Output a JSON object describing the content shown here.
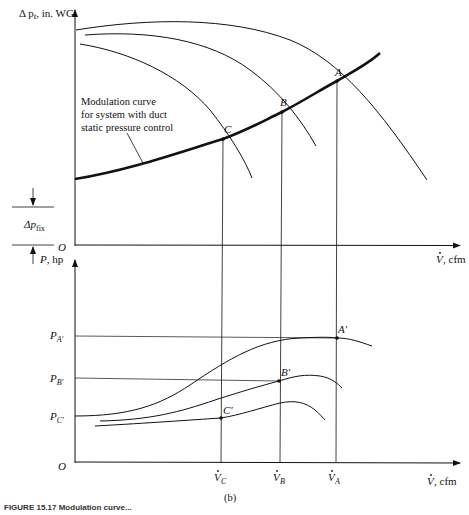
{
  "figure": {
    "panel_label": "(b)",
    "caption_partial": "FIGURE 15.17  Modulation curve..."
  },
  "upper_plot": {
    "y_axis_label": "Δ p",
    "y_axis_sub": "t",
    "y_axis_unit": ", in. WG",
    "x_axis_label": "V",
    "x_axis_unit": ", cfm",
    "origin": "O",
    "fix_label": "Δp",
    "fix_sub": "fix",
    "annotation": [
      "Modulation curve",
      "for system with duct",
      "static pressure control"
    ],
    "points": [
      {
        "name": "A",
        "x": 337,
        "y": 81
      },
      {
        "name": "B",
        "x": 282,
        "y": 112
      },
      {
        "name": "C",
        "x": 223,
        "y": 139
      }
    ]
  },
  "lower_plot": {
    "y_axis_label": "P",
    "y_axis_unit": ", hp",
    "x_axis_label": "V",
    "x_axis_unit": ", cfm",
    "origin": "O",
    "p_levels": [
      {
        "name": "P",
        "sub": "A′",
        "y": 338
      },
      {
        "name": "P",
        "sub": "B′",
        "y": 379
      },
      {
        "name": "P",
        "sub": "C′",
        "y": 416
      }
    ],
    "points": [
      {
        "name": "A′",
        "x": 337,
        "y": 338
      },
      {
        "name": "B′",
        "x": 279,
        "y": 381
      },
      {
        "name": "C′",
        "x": 221,
        "y": 418
      }
    ],
    "x_ticks": [
      {
        "name": "V",
        "sub": "C",
        "x": 221
      },
      {
        "name": "V",
        "sub": "B",
        "x": 281
      },
      {
        "name": "V",
        "sub": "A",
        "x": 335
      }
    ]
  },
  "colors": {
    "line": "#111111",
    "background": "#ffffff"
  }
}
